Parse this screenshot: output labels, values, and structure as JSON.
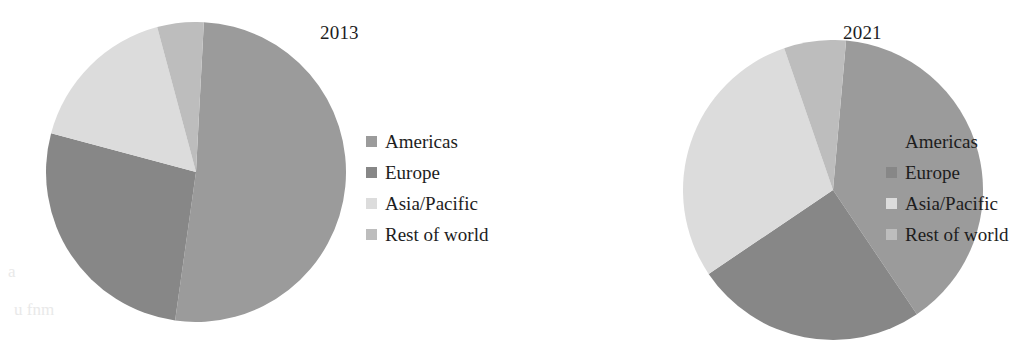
{
  "figure": {
    "background": "#ffffff",
    "width": 1030,
    "height": 362
  },
  "palette": {
    "americas": "#9b9b9b",
    "europe": "#878787",
    "asia_pacific": "#dcdcdc",
    "rest_of_world": "#bdbdbd"
  },
  "legend": {
    "items": [
      {
        "label": "Americas",
        "color": "#9b9b9b"
      },
      {
        "label": "Europe",
        "color": "#878787"
      },
      {
        "label": "Asia/Pacific",
        "color": "#dcdcdc"
      },
      {
        "label": "Rest of world",
        "color": "#bdbdbd"
      }
    ]
  },
  "charts": [
    {
      "title": "2013",
      "center": {
        "x": 150,
        "y": 150
      },
      "radius": 150,
      "slices": [
        {
          "label": "Americas",
          "color": "#9b9b9b",
          "start_angle": 3,
          "end_angle": 188
        },
        {
          "label": "Europe",
          "color": "#878787",
          "start_angle": 188,
          "end_angle": 285
        },
        {
          "label": "Asia/Pacific",
          "color": "#dcdcdc",
          "start_angle": 285,
          "end_angle": 345
        },
        {
          "label": "Rest of world",
          "color": "#bdbdbd",
          "start_angle": 345,
          "end_angle": 363
        }
      ]
    },
    {
      "title": "2021",
      "center": {
        "x": 150,
        "y": 150
      },
      "radius": 150,
      "slices": [
        {
          "label": "Americas",
          "color": "#9b9b9b",
          "start_angle": 5,
          "end_angle": 146
        },
        {
          "label": "Europe",
          "color": "#878787",
          "start_angle": 146,
          "end_angle": 236
        },
        {
          "label": "Asia/Pacific",
          "color": "#dcdcdc",
          "start_angle": 236,
          "end_angle": 341
        },
        {
          "label": "Rest of world",
          "color": "#bdbdbd",
          "start_angle": 341,
          "end_angle": 365
        }
      ]
    }
  ],
  "chart_data": {
    "type": "pie",
    "title": "",
    "legend_position": "right",
    "categories": [
      "Americas",
      "Europe",
      "Asia/Pacific",
      "Rest of world"
    ],
    "colors": [
      "#9b9b9b",
      "#878787",
      "#dcdcdc",
      "#bdbdbd"
    ],
    "series": [
      {
        "name": "2013",
        "unit": "percent",
        "values": [
          51.4,
          26.9,
          16.7,
          5.0
        ]
      },
      {
        "name": "2021",
        "unit": "percent",
        "values": [
          39.2,
          25.0,
          29.2,
          6.6
        ]
      }
    ]
  },
  "artifacts": {
    "bleed_left": "a",
    "bleed_bottom": "u fnm"
  }
}
